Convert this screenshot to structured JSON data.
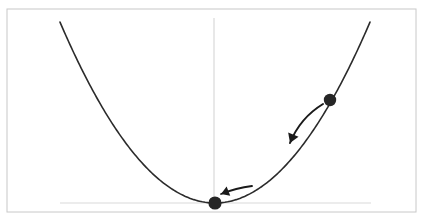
{
  "figure": {
    "type": "diagram",
    "background_color": "#ffffff",
    "border": {
      "name": "figure-border",
      "color": "#c8c8c8",
      "stroke_width": 1,
      "x": 7,
      "y": 9,
      "width": 409,
      "height": 203
    },
    "axes": {
      "color": "#d9d9d9",
      "stroke_width": 1.2,
      "vertical": {
        "name": "vertical-axis",
        "x": 214,
        "y_top": 18,
        "y_bottom": 205
      },
      "horizontal": {
        "name": "horizontal-axis",
        "y": 203,
        "x_left": 60,
        "x_right": 371
      }
    },
    "curve": {
      "name": "parabola-curve",
      "color": "#2b2b2b",
      "stroke_width": 1.6,
      "vertex": {
        "x": 215,
        "y": 203
      },
      "left_endpoint": {
        "x": 60,
        "y": 22
      },
      "right_endpoint": {
        "x": 370,
        "y": 22
      },
      "coefficient_a": 0.00753
    },
    "points": [
      {
        "name": "vertex-point",
        "label": "minimum",
        "x": 215,
        "y": 203,
        "radius": 6.6,
        "color": "#262626"
      },
      {
        "name": "current-point",
        "label": "current position",
        "x": 330,
        "y": 100,
        "radius": 6.2,
        "color": "#262626"
      }
    ],
    "arrows": [
      {
        "name": "descent-arrow-long",
        "color": "#1a1a1a",
        "stroke_width": 2.0,
        "start": {
          "x": 323,
          "y": 104
        },
        "control": {
          "x": 300,
          "y": 118
        },
        "end": {
          "x": 290,
          "y": 143
        },
        "head_size": 9
      },
      {
        "name": "descent-arrow-short",
        "color": "#1a1a1a",
        "stroke_width": 1.8,
        "start": {
          "x": 252,
          "y": 186
        },
        "control": {
          "x": 236,
          "y": 188
        },
        "end": {
          "x": 221,
          "y": 194
        },
        "head_size": 8
      }
    ]
  }
}
